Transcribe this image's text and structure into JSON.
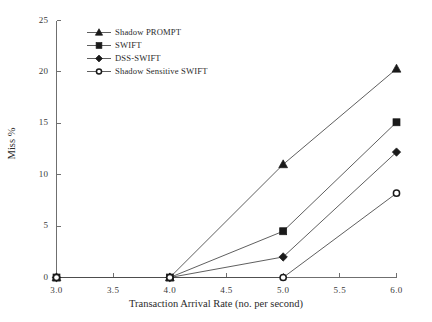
{
  "chart_data": {
    "type": "line",
    "title": "",
    "xlabel": "Transaction Arrival Rate (no. per second)",
    "ylabel": "Miss %",
    "x": [
      3.0,
      4.0,
      5.0,
      6.0
    ],
    "xlim": [
      3.0,
      6.0
    ],
    "ylim": [
      0,
      25
    ],
    "xticks": [
      "3.0",
      "3.5",
      "4.0",
      "4.5",
      "5.0",
      "5.5",
      "6.0"
    ],
    "xtick_values": [
      3.0,
      3.5,
      4.0,
      4.5,
      5.0,
      5.5,
      6.0
    ],
    "yticks": [
      "0",
      "5",
      "10",
      "15",
      "20",
      "25"
    ],
    "ytick_values": [
      0,
      5,
      10,
      15,
      20,
      25
    ],
    "grid": false,
    "legend_position": "upper-left-inside",
    "series": [
      {
        "name": "Shadow PROMPT",
        "marker": "triangle-filled",
        "color": "#1a1a1a",
        "values": [
          0,
          0,
          11.0,
          20.3
        ]
      },
      {
        "name": "SWIFT",
        "marker": "square-filled",
        "color": "#1a1a1a",
        "values": [
          0,
          0,
          4.5,
          15.1
        ]
      },
      {
        "name": "DSS-SWIFT",
        "marker": "diamond-filled",
        "color": "#1a1a1a",
        "values": [
          0,
          0,
          2.0,
          12.2
        ]
      },
      {
        "name": "Shadow Sensitive SWIFT",
        "marker": "circle-open",
        "color": "#1a1a1a",
        "values": [
          0,
          0,
          0.0,
          8.2
        ]
      }
    ]
  },
  "legend": {
    "items": [
      {
        "label": "Shadow PROMPT",
        "marker": "triangle-filled"
      },
      {
        "label": "SWIFT",
        "marker": "square-filled"
      },
      {
        "label": "DSS-SWIFT",
        "marker": "diamond-filled"
      },
      {
        "label": "Shadow Sensitive SWIFT",
        "marker": "circle-open"
      }
    ]
  },
  "axes": {
    "x_title": "Transaction Arrival Rate (no. per second)",
    "y_title": "Miss %"
  }
}
